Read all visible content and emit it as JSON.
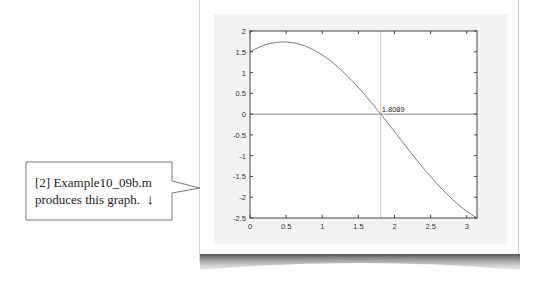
{
  "callout": {
    "line1": "[2] Example10_09b.m",
    "line2": "produces this graph.",
    "arrow": "↓"
  },
  "annotation": {
    "root_label": "1.8089"
  },
  "chart_data": {
    "type": "line",
    "title": "",
    "xlabel": "",
    "ylabel": "",
    "xlim": [
      0,
      3.1416
    ],
    "ylim": [
      -2.5,
      2
    ],
    "grid": false,
    "legend": null,
    "x_ticks": [
      "0",
      "0.5",
      "1",
      "1.5",
      "2",
      "2.5",
      "3"
    ],
    "y_ticks": [
      "2",
      "1.5",
      "1",
      "0.5",
      "0",
      "-0.5",
      "-1",
      "-1.5",
      "-2",
      "-2.5"
    ],
    "series": [
      {
        "name": "f(x)",
        "x": [
          0,
          0.25,
          0.4636,
          0.75,
          1.0,
          1.25,
          1.5,
          1.75,
          1.8089,
          2.0,
          2.25,
          2.5,
          2.75,
          3.0,
          3.1416
        ],
        "values": [
          1.5,
          1.685,
          1.736,
          1.645,
          1.422,
          1.08,
          0.639,
          0.12,
          0.0,
          -0.423,
          -0.978,
          -1.504,
          -1.967,
          -2.339,
          -2.5
        ]
      }
    ],
    "reference_lines": [
      {
        "orientation": "horizontal",
        "value": 0
      },
      {
        "orientation": "vertical",
        "value": 1.8089
      }
    ],
    "annotations": [
      {
        "text": "1.8089",
        "x": 1.8089,
        "y": 0
      }
    ]
  }
}
